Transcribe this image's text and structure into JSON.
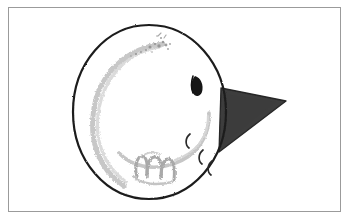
{
  "artwork": {
    "title": "Hand-drawn sketch of a round face with a pointed beak",
    "medium": "pencil and ink on paper",
    "background_color": "#ffffff",
    "frame": {
      "name": "thin rectangular border",
      "color": "#9b9b9b",
      "stroke_width": 1,
      "x": 8,
      "y": 7,
      "width": 333,
      "height": 205
    },
    "elements": [
      {
        "name": "head-circle",
        "label": "Large hand-drawn circle outline (head)",
        "shape": "ellipse",
        "cx": 149,
        "cy": 112,
        "rx": 77,
        "ry": 87,
        "stroke_color": "#1d1d1d",
        "stroke_width": 2.1,
        "fill": "none"
      },
      {
        "name": "inner-crescent-arc",
        "label": "Faint pencil crescent arc inside left of head",
        "stroke_color": "#b9b9b9",
        "stroke_width": 4.5,
        "fill": "none"
      },
      {
        "name": "speckle-marks",
        "label": "Light speckled pencil dots near top of head",
        "color": "#8f8f8f",
        "count": 14
      },
      {
        "name": "eye",
        "label": "Dark leaf-shaped eye",
        "fill_color": "#121212",
        "cx": 197,
        "cy": 86
      },
      {
        "name": "cheek-curve",
        "label": "Pale grey curved cheek/jaw line",
        "stroke_color": "#c2c2c2",
        "stroke_width": 3.4,
        "fill": "none"
      },
      {
        "name": "comma-mark-upper",
        "label": "Small crescent comma mark (upper)",
        "stroke_color": "#2a2a2a",
        "cx": 188,
        "cy": 140
      },
      {
        "name": "comma-mark-middle",
        "label": "Small crescent comma mark (middle)",
        "stroke_color": "#2a2a2a",
        "cx": 200,
        "cy": 155
      },
      {
        "name": "comma-mark-lower",
        "label": "Small crescent comma mark (lower)",
        "stroke_color": "#2a2a2a",
        "cx": 210,
        "cy": 166
      },
      {
        "name": "scribble-m",
        "label": "Grey handwritten m-like scribble near bottom",
        "stroke_color": "#a8a8a8",
        "stroke_width": 3.0,
        "text_like": "m"
      },
      {
        "name": "beak-triangle",
        "label": "Dark charcoal triangle pointing right (beak)",
        "fill_color": "#3c3c3c",
        "stroke_color": "#2a2a2a",
        "points": "221,88 286,101 219,152"
      }
    ]
  }
}
